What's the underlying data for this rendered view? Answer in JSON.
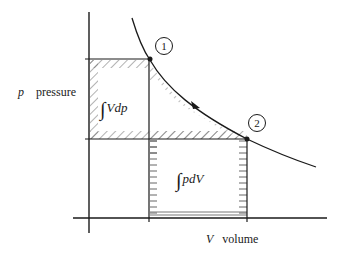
{
  "diagram": {
    "type": "p-V diagram",
    "y_axis": {
      "symbol": "p",
      "label": "pressure"
    },
    "x_axis": {
      "symbol": "V",
      "label": "volume"
    },
    "states": [
      {
        "id": "1",
        "label": "1"
      },
      {
        "id": "2",
        "label": "2"
      }
    ],
    "regions": {
      "vdp": {
        "symbol": "∫",
        "expr": "Vdp"
      },
      "pdv": {
        "symbol": "∫",
        "expr": "pdV"
      }
    },
    "colors": {
      "ink": "#1a1a1a",
      "hatch": "#555555"
    }
  }
}
